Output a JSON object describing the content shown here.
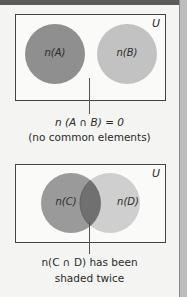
{
  "diagram1": {
    "universal_label": "U",
    "set_a_label": "n(A)",
    "set_b_label": "n(B)",
    "caption_line1": "n (A ∩ B) = 0",
    "caption_line2": "(no common elements)"
  },
  "diagram2": {
    "universal_label": "U",
    "set_c_label": "n(C)",
    "set_d_label": "n(D)",
    "caption_line1": "n(C ∩ D) has been",
    "caption_line2": "shaded twice"
  },
  "colors": {
    "set_a": "#8f8f8f",
    "set_b": "#c2c2c2",
    "set_c": "#9a9a9a",
    "set_d": "#cfcfcf",
    "intersection": "#707070"
  }
}
